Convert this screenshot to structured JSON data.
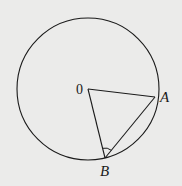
{
  "diagram": {
    "type": "circle-geometry",
    "points": {
      "O": {
        "label": "0",
        "x": 88,
        "y": 89
      },
      "A": {
        "label": "A",
        "x": 155,
        "y": 97
      },
      "B": {
        "label": "B",
        "x": 105,
        "y": 158
      }
    },
    "circle": {
      "cx": 88,
      "cy": 89,
      "r": 71
    },
    "segments": [
      "OA",
      "OB",
      "AB"
    ],
    "angle_marks": [
      "OBA"
    ],
    "colors": {
      "stroke": "#1a1a1a",
      "background": "#ebebea"
    }
  }
}
